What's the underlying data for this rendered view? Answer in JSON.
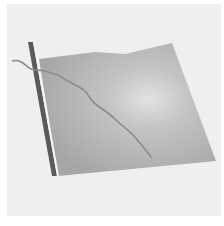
{
  "image": {
    "description": "Gray rectangular flag on a dark pole with a thin wavy line crossing the flag",
    "colors": {
      "background": "#efefef",
      "flag_center": "#d8d8d8",
      "flag_edge": "#a8a8a8",
      "pole": "#5a5a5a",
      "line": "#8a8a8a"
    }
  }
}
